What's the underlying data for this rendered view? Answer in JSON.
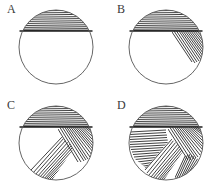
{
  "figure": {
    "type": "diagram",
    "background_color": "#ffffff",
    "outline_color": "#555555",
    "hatch_color": "#2b2b2b",
    "chord_color": "#1c1c1c",
    "layout": {
      "columns": 2,
      "rows": 2,
      "panel_width": 110,
      "panel_height": 96
    },
    "panels": [
      {
        "label": "A",
        "circle": {
          "cx": 56,
          "cy": 47,
          "r": 37
        },
        "chord_y": 31,
        "regions": [
          {
            "name": "top-cap-horizontal-hatch",
            "orientation": "horizontal",
            "angle_deg": 0,
            "line_count": 11,
            "fill_fraction": 0.17
          }
        ]
      },
      {
        "label": "B",
        "circle": {
          "cx": 56,
          "cy": 47,
          "r": 37
        },
        "chord_y": 31,
        "regions": [
          {
            "name": "top-cap-horizontal-hatch",
            "orientation": "horizontal",
            "angle_deg": 0,
            "line_count": 11,
            "fill_fraction": 0.17
          },
          {
            "name": "right-diagonal-hatch",
            "orientation": "diagonal-down-right",
            "angle_deg": 55,
            "line_count": 14,
            "fill_fraction": 0.2
          }
        ]
      },
      {
        "label": "C",
        "circle": {
          "cx": 56,
          "cy": 47,
          "r": 37
        },
        "chord_y": 31,
        "regions": [
          {
            "name": "top-cap-horizontal-hatch",
            "orientation": "horizontal",
            "angle_deg": 0,
            "line_count": 11,
            "fill_fraction": 0.17
          },
          {
            "name": "right-diagonal-hatch",
            "orientation": "diagonal-down-right",
            "angle_deg": 55,
            "line_count": 16,
            "fill_fraction": 0.2
          },
          {
            "name": "lower-left-diagonal-hatch",
            "orientation": "diagonal-up-right",
            "angle_deg": -45,
            "line_count": 18,
            "fill_fraction": 0.22
          }
        ]
      },
      {
        "label": "D",
        "circle": {
          "cx": 56,
          "cy": 47,
          "r": 37
        },
        "chord_y": 31,
        "regions": [
          {
            "name": "top-cap-horizontal-hatch",
            "orientation": "horizontal",
            "angle_deg": 0,
            "line_count": 11,
            "fill_fraction": 0.17
          },
          {
            "name": "right-diagonal-hatch",
            "orientation": "diagonal-down-right",
            "angle_deg": 55,
            "line_count": 16,
            "fill_fraction": 0.2
          },
          {
            "name": "lower-left-diagonal-hatch",
            "orientation": "diagonal-up-right",
            "angle_deg": -45,
            "line_count": 18,
            "fill_fraction": 0.22
          },
          {
            "name": "left-horizontal-hatch",
            "orientation": "horizontal-slight",
            "angle_deg": 8,
            "line_count": 16,
            "fill_fraction": 0.2
          },
          {
            "name": "bottom-right-diagonal-hatch",
            "orientation": "diagonal-steep",
            "angle_deg": 70,
            "line_count": 12,
            "fill_fraction": 0.15
          }
        ]
      }
    ]
  }
}
